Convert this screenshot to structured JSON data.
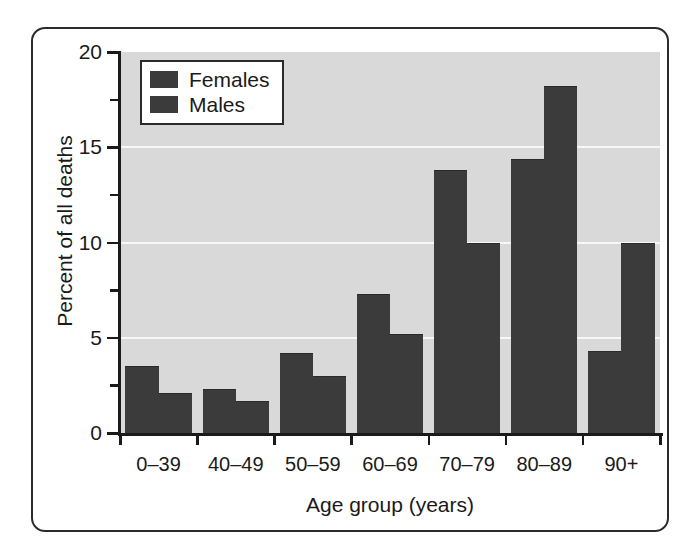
{
  "chart_data": {
    "type": "bar",
    "title": "",
    "xlabel": "Age group (years)",
    "ylabel": "Percent of all deaths",
    "categories": [
      "0–39",
      "40–49",
      "50–59",
      "60–69",
      "70–79",
      "80–89",
      "90+"
    ],
    "series": [
      {
        "name": "Females",
        "color": "#3b3b3b",
        "values": [
          3.5,
          2.3,
          4.2,
          7.3,
          13.8,
          14.4,
          4.3
        ]
      },
      {
        "name": "Males",
        "color": "#3b3b3b",
        "values": [
          2.1,
          1.7,
          3.0,
          5.2,
          10.0,
          18.2,
          10.0
        ]
      }
    ],
    "ylim": [
      0,
      20
    ],
    "yticks": [
      0,
      5,
      10,
      15,
      20
    ],
    "ytick_labels": [
      "0",
      "5",
      "10",
      "15",
      "20"
    ],
    "yminor_ticks": [
      2.5,
      7.5,
      12.5,
      17.5
    ],
    "gridlines": [
      5,
      10,
      15
    ],
    "grid": true,
    "legend_position": "top-left",
    "plot_background": "#d9d9d9",
    "gridline_color": "#f7f7f7",
    "axis_color": "#1a1a1a",
    "frame_color": "#2b2b2b"
  }
}
